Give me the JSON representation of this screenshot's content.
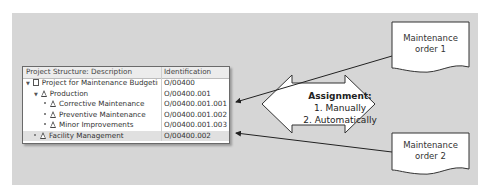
{
  "table": {
    "headers": [
      "Project Structure: Description",
      "Identification"
    ],
    "rows": [
      {
        "description": "Project for Maintenance Budgetir",
        "id": "O/00400",
        "level": 0,
        "icon": "project-icon",
        "expanded": true
      },
      {
        "description": "Production",
        "id": "O/00400.001",
        "level": 1,
        "icon": "wbs-triangle-icon",
        "expanded": true
      },
      {
        "description": "Corrective Maintenance",
        "id": "O/00400.001.001",
        "level": 2,
        "icon": "wbs-triangle-icon"
      },
      {
        "description": "Preventive Maintenance",
        "id": "O/00400.001.002",
        "level": 2,
        "icon": "wbs-triangle-icon"
      },
      {
        "description": "Minor Improvements",
        "id": "O/00400.001.003",
        "level": 2,
        "icon": "wbs-triangle-icon"
      },
      {
        "description": "Facility Management",
        "id": "O/00400.002",
        "level": 1,
        "icon": "wbs-triangle-icon",
        "selected": true
      }
    ]
  },
  "assignment": {
    "title": "Assignment:",
    "lines": [
      "1. Manually",
      "2. Automatically"
    ]
  },
  "documents": [
    {
      "line1": "Maintenance",
      "line2": "order 1",
      "points_to": "Corrective Maintenance"
    },
    {
      "line1": "Maintenance",
      "line2": "order 2",
      "points_to": "Facility Management"
    }
  ],
  "colors": {
    "background": "#d6d6d6",
    "shape_fill": "#ffffff",
    "stroke": "#333333"
  }
}
